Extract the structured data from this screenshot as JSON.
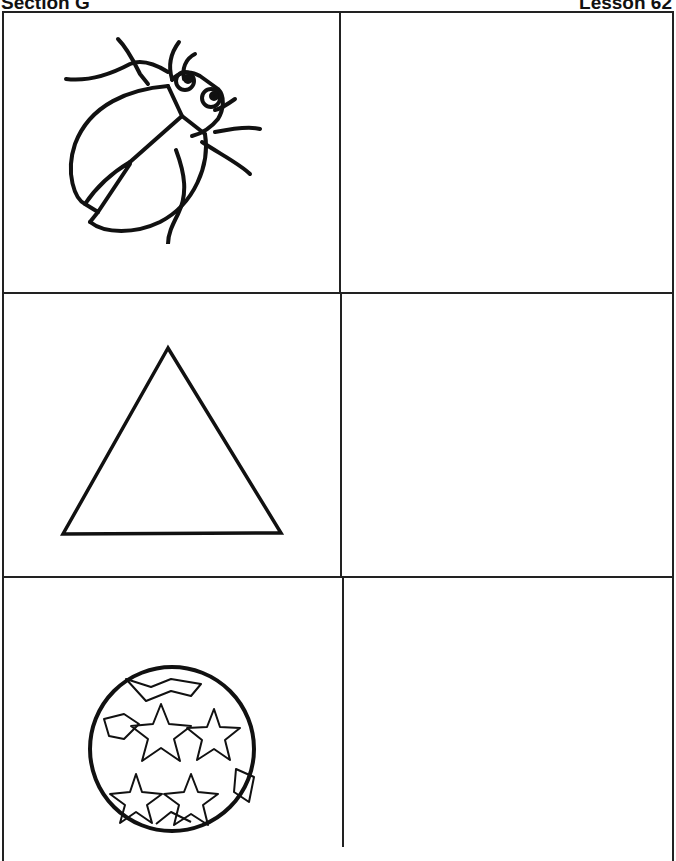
{
  "header": {
    "section": "Section G",
    "lesson": "Lesson 62"
  },
  "worksheet": {
    "rows": [
      {
        "picture": "beetle",
        "answer": ""
      },
      {
        "picture": "triangle",
        "answer": ""
      },
      {
        "picture": "star-ball",
        "answer": ""
      }
    ]
  },
  "colors": {
    "ink": "#111111",
    "paper": "#ffffff"
  }
}
